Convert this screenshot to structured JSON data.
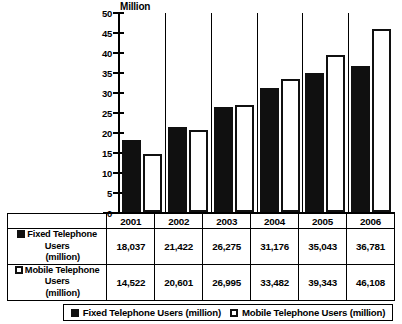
{
  "chart_data": {
    "type": "bar",
    "title": "",
    "unit_label": "Million",
    "xlabel": "",
    "ylabel": "",
    "ylim": [
      0,
      50
    ],
    "yticks": [
      0,
      5,
      10,
      15,
      20,
      25,
      30,
      35,
      40,
      45,
      50
    ],
    "grid": false,
    "legend_position": "bottom",
    "categories": [
      "2001",
      "2002",
      "2003",
      "2004",
      "2005",
      "2006"
    ],
    "series": [
      {
        "name": "Fixed Telephone Users (million)",
        "label_line1": "Fixed Telephone Users",
        "label_line2": "(million)",
        "swatch": "filled",
        "values": [
          18.037,
          21.422,
          26.275,
          31.176,
          35.043,
          36.781
        ],
        "display_values": [
          "18,037",
          "21,422",
          "26,275",
          "31,176",
          "35,043",
          "36,781"
        ]
      },
      {
        "name": "Mobile Telephone Users (million)",
        "label_line1": "Mobile Telephone Users",
        "label_line2": "(million)",
        "swatch": "hollow",
        "values": [
          14.522,
          20.601,
          26.995,
          33.482,
          39.343,
          46.108
        ],
        "display_values": [
          "14,522",
          "20,601",
          "26,995",
          "33,482",
          "39,343",
          "46,108"
        ]
      }
    ]
  },
  "colors": {
    "fixed": "#101010",
    "mobile": "#ffffff",
    "outline": "#000000",
    "background": "#ffffff"
  }
}
